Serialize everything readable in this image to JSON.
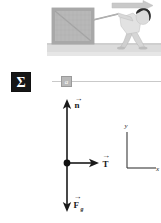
{
  "illustration": {
    "name": "person-pulling-crate-scene",
    "motion_arrow": "motion-arrow-right",
    "crate": "wooden-crate",
    "figure": "person-pulling",
    "rope": "rope",
    "ground": "ground-surface",
    "colors": {
      "crate_fill": "#b6b6b6",
      "ground_fill": "#d9d9d9",
      "figure_fill": "#d2d2d2",
      "hair_fill": "#2b2b2b",
      "arrow_fill": "#c4c4c4"
    }
  },
  "toolbar": {
    "sigma_label": "Σ"
  },
  "slider": {
    "handle_label": "a",
    "value": 8,
    "min": 0,
    "max": 100
  },
  "diagram": {
    "type": "free-body-diagram",
    "origin_label": "",
    "vectors": [
      {
        "name": "normal-force",
        "label": "n",
        "direction": "up",
        "hat": "→"
      },
      {
        "name": "tension-force",
        "label": "T",
        "direction": "right",
        "hat": "→"
      },
      {
        "name": "gravity-force",
        "label": "F",
        "sub": "g",
        "direction": "down",
        "hat": "→"
      }
    ],
    "axes": {
      "x_label": "x",
      "y_label": "y"
    },
    "colors": {
      "vector_stroke": "#1a1a1a",
      "axis_stroke": "#3a3a3a"
    }
  }
}
